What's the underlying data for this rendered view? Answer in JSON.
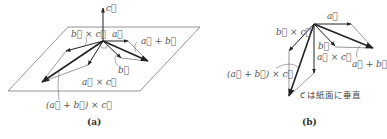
{
  "panels": [
    {
      "id": "a",
      "caption": "(a)",
      "labels": {
        "c": "c⃗",
        "a": "a⃗",
        "a_plus_b": "a⃗ + b⃗",
        "b": "b⃗",
        "b_cross_c": "b⃗ × c⃗",
        "a_cross_c": "a⃗ × c⃗",
        "a_plus_b_cross_c": "(a⃗ + b⃗) × c⃗"
      }
    },
    {
      "id": "b",
      "caption": "(b)",
      "labels": {
        "a": "a⃗",
        "a_plus_b": "a⃗ + b⃗",
        "b": "b⃗",
        "b_cross_c": "b⃗ × c⃗",
        "a_cross_c": "a⃗ × c⃗",
        "a_plus_b_cross_c": "(a⃗ + b⃗) × c⃗",
        "c_note": "c⃗ は紙面に垂直"
      }
    }
  ],
  "colors": {
    "line": "#222222",
    "thin": "#555555",
    "text": "#555555"
  }
}
